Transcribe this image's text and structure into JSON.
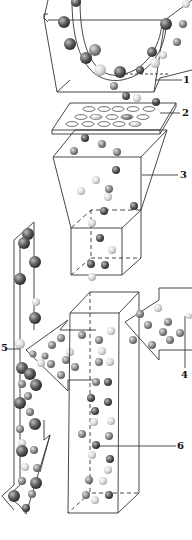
{
  "diagram": {
    "type": "process-illustration",
    "components": [
      {
        "id": "1",
        "label": "1",
        "description": "bowl/hopper containing mixed spheres"
      },
      {
        "id": "2",
        "label": "2",
        "description": "perforated plate (sieve) with holes"
      },
      {
        "id": "3",
        "label": "3",
        "description": "funnel section"
      },
      {
        "id": "4",
        "label": "4",
        "description": "right arrow inlet"
      },
      {
        "id": "5",
        "label": "5",
        "description": "left outlet column with arrow"
      },
      {
        "id": "6",
        "label": "6",
        "description": "tall vertical column"
      }
    ],
    "colors": {
      "line": "#333333",
      "ball_dark": "#555555",
      "ball_mid": "#888888",
      "ball_light": "#cfcfcf",
      "background": "#ffffff"
    }
  },
  "labels": {
    "l1": "1",
    "l2": "2",
    "l3": "3",
    "l4": "4",
    "l5": "5",
    "l6": "6"
  }
}
